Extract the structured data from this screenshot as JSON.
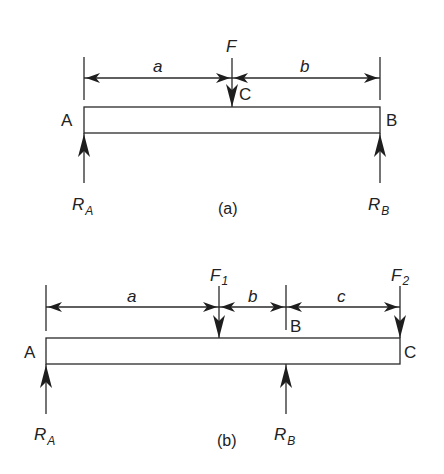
{
  "figure_a": {
    "caption": "(a)",
    "point_left": "A",
    "point_right": "B",
    "point_load": "C",
    "force": "F",
    "dim_left": "a",
    "dim_right": "b",
    "reaction_left": {
      "main": "R",
      "sub": "A"
    },
    "reaction_right": {
      "main": "R",
      "sub": "B"
    }
  },
  "figure_b": {
    "caption": "(b)",
    "point_left": "A",
    "point_mid": "B",
    "point_right": "C",
    "force_1": {
      "main": "F",
      "sub": "1"
    },
    "force_2": {
      "main": "F",
      "sub": "2"
    },
    "dim_1": "a",
    "dim_2": "b",
    "dim_3": "c",
    "reaction_left": {
      "main": "R",
      "sub": "A"
    },
    "reaction_mid": {
      "main": "R",
      "sub": "B"
    }
  }
}
